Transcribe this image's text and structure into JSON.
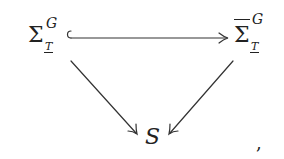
{
  "diagram": {
    "type": "commutative-triangle",
    "nodes": {
      "left": {
        "base": "Σ",
        "sup": "G",
        "sub": "T",
        "sub_underlined": true
      },
      "right": {
        "base": "Σ",
        "overline": true,
        "sup": "G",
        "sub": "T",
        "sub_underlined": true
      },
      "bottom": {
        "label": "S"
      }
    },
    "edges": [
      {
        "from": "left",
        "to": "right",
        "style": "hook-arrow",
        "meaning": "inclusion"
      },
      {
        "from": "left",
        "to": "bottom",
        "style": "arrow"
      },
      {
        "from": "right",
        "to": "bottom",
        "style": "arrow"
      }
    ],
    "trailing_punctuation": ","
  }
}
